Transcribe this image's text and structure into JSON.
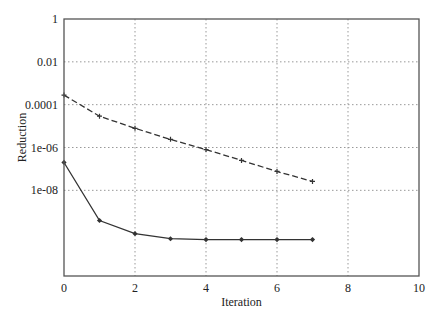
{
  "chart_data": {
    "type": "line",
    "title": "",
    "xlabel": "Iteration",
    "ylabel": "Reduction",
    "xlim": [
      0,
      10
    ],
    "ylim": [
      1e-12,
      1
    ],
    "yscale": "log",
    "grid": true,
    "legend": null,
    "x_ticks": [
      0,
      2,
      4,
      6,
      8,
      10
    ],
    "x_tick_labels": [
      "0",
      "2",
      "4",
      "6",
      "8",
      "10"
    ],
    "y_ticks": [
      1,
      0.01,
      0.0001,
      1e-06,
      1e-08
    ],
    "y_tick_labels": [
      "1",
      "0.01",
      "0.0001",
      "1e-06",
      "1e-08"
    ],
    "series": [
      {
        "name": "dashed",
        "style": "dashed",
        "marker": "plus",
        "color": "#333333",
        "x": [
          0,
          1,
          2,
          3,
          4,
          5,
          6,
          7
        ],
        "values": [
          0.00028,
          2.9e-05,
          7.9e-06,
          2.4e-06,
          8e-07,
          2.5e-07,
          7.6e-08,
          2.6e-08
        ]
      },
      {
        "name": "solid",
        "style": "solid",
        "marker": "diamond",
        "color": "#333333",
        "x": [
          0,
          1,
          2,
          3,
          4,
          5,
          6,
          7
        ],
        "values": [
          2e-07,
          3.9e-10,
          9.5e-11,
          5.5e-11,
          5e-11,
          5e-11,
          5e-11,
          5e-11
        ]
      }
    ]
  },
  "layout": {
    "plot": {
      "left": 64,
      "top": 19,
      "right": 419,
      "bottom": 276
    },
    "frame_color": "#555555",
    "grid_color": "#999999"
  }
}
